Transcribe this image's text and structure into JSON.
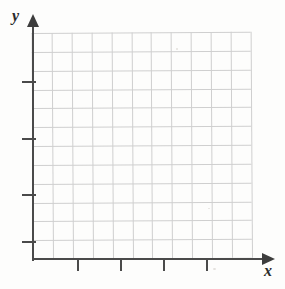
{
  "figure": {
    "type": "blank-coordinate-grid",
    "title": "",
    "background_color": "#fdfdfc",
    "axis_color": "#4a4a4a",
    "grid_color": "#cfcfcf"
  },
  "axes": {
    "y": {
      "label": "y",
      "arrow": "up",
      "line": {
        "x": 33,
        "top": 24,
        "bottom": 261
      },
      "ticks": [
        {
          "y": 81
        },
        {
          "y": 138
        },
        {
          "y": 194
        },
        {
          "y": 241
        }
      ]
    },
    "x": {
      "label": "x",
      "arrow": "right",
      "line": {
        "y": 259,
        "left": 32,
        "right": 264
      },
      "ticks": [
        {
          "x": 77
        },
        {
          "x": 120
        },
        {
          "x": 163
        },
        {
          "x": 206
        }
      ]
    }
  },
  "grid": {
    "left": 33,
    "top": 33,
    "width": 219,
    "height": 226,
    "columns": 11,
    "rows": 12,
    "cell_width": 19.9,
    "cell_height": 18.8,
    "vertical_line_count": 12,
    "horizontal_line_count": 13
  },
  "chart_data": {
    "type": "scatter",
    "title": "",
    "xlabel": "x",
    "ylabel": "y",
    "series": [],
    "x": [],
    "values": [],
    "grid": true,
    "legend": "none",
    "xlim": [
      0,
      11
    ],
    "ylim": [
      0,
      12
    ],
    "xticks": [
      2,
      4,
      6,
      8
    ],
    "yticks": [
      3,
      6,
      9,
      12
    ],
    "xticklabels": [
      "",
      "",
      "",
      ""
    ],
    "yticklabels": [
      "",
      "",
      "",
      ""
    ],
    "annotations": [],
    "note": "Empty graph-paper coordinate plane: no plotted data, unlabeled tick marks."
  }
}
